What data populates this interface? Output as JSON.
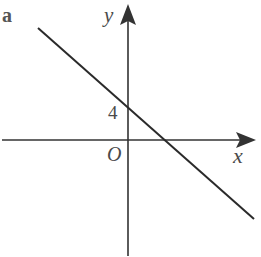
{
  "part_label": "a",
  "axes": {
    "x_label": "x",
    "y_label": "y",
    "origin_label": "O"
  },
  "annotations": {
    "y_intercept_label": "4"
  },
  "colors": {
    "axis": "#333333",
    "line": "#2a2a2a",
    "text": "#4a4a4a"
  },
  "line": {
    "description": "straight line with negative gradient",
    "y_intercept": 4
  }
}
